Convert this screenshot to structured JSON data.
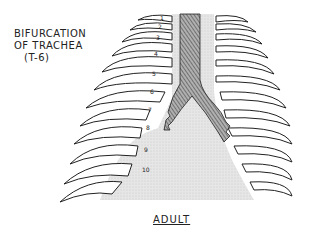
{
  "diagram": {
    "annotation": {
      "line1": "BIFURCATION",
      "line2": "OF TRACHEA",
      "line3": "(T-6)"
    },
    "caption": "ADULT",
    "rib_numbers": [
      "1",
      "2",
      "3",
      "4",
      "5",
      "6",
      "7",
      "8",
      "9",
      "10"
    ],
    "colors": {
      "outline": "#222222",
      "trachea_fill": "#8a8a8a",
      "mediastinum_fill": "#e4e4e4",
      "background": "#ffffff"
    }
  }
}
